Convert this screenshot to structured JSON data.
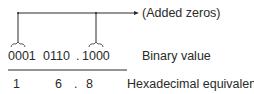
{
  "diagram": {
    "annotation": "(Added zeros)",
    "binary": {
      "groups": [
        "0001",
        "0110",
        ".",
        "1000"
      ],
      "label": "Binary value"
    },
    "hex": {
      "digits": [
        "1",
        "6",
        ".",
        "8"
      ],
      "label": "Hexadecimal equivalent"
    },
    "colors": {
      "ink": "#2a2a2a",
      "background": "#ffffff"
    }
  }
}
